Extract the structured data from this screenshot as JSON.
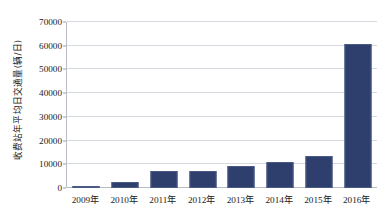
{
  "chart_data": {
    "type": "bar",
    "title": "",
    "subtitle": "",
    "xlabel": "",
    "ylabel": "收费站年平均日交通量(辆/日)",
    "categories": [
      "2009年",
      "2010年",
      "2011年",
      "2012年",
      "2013年",
      "2014年",
      "2015年",
      "2016年"
    ],
    "values": [
      500,
      2500,
      7000,
      7300,
      9300,
      11000,
      13500,
      60800
    ],
    "series": [
      {
        "name": "收费站年平均日交通量",
        "values": [
          500,
          2500,
          7000,
          7300,
          9300,
          11000,
          13500,
          60800
        ]
      }
    ],
    "ylim": [
      0,
      70000
    ],
    "y_ticks": [
      0,
      10000,
      20000,
      30000,
      40000,
      50000,
      60000,
      70000
    ],
    "y_tick_labels": [
      "0",
      "10000",
      "20000",
      "30000",
      "40000",
      "50000",
      "60000",
      "70000"
    ],
    "grid": true,
    "legend": false,
    "legend_position": "none",
    "bar_color": "#2f3f6d",
    "bar_edge_color": "#4a5986",
    "gridline_color": "#d6dae0",
    "axis_color": "#b9bcc2",
    "background_color": "#ffffff",
    "annotations": []
  }
}
